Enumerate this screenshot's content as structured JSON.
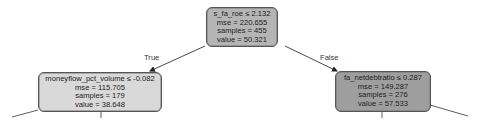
{
  "diagram": {
    "type": "decision-tree-regressor",
    "nodes": [
      {
        "id": "root",
        "condition": "s_fa_roe ≤ 2.132",
        "mse": "mse = 220.655",
        "samples": "samples = 455",
        "value": "value = 50.321",
        "fill": "#b5b5b5"
      },
      {
        "id": "left",
        "condition": "moneyflow_pct_volume ≤ -0.082",
        "mse": "mse = 115.705",
        "samples": "samples = 179",
        "value": "value = 38.648",
        "fill": "#d9d9d9"
      },
      {
        "id": "right",
        "condition": "fa_netdebtratio ≤ 0.287",
        "mse": "mse = 149.287",
        "samples": "samples = 276",
        "value": "value = 57.533",
        "fill": "#9e9e9e"
      }
    ],
    "edges": [
      {
        "from": "root",
        "to": "left",
        "label": "True"
      },
      {
        "from": "root",
        "to": "right",
        "label": "False"
      }
    ]
  }
}
